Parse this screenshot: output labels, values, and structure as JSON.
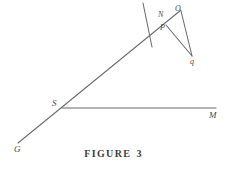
{
  "figure": {
    "caption_text": "FIGURE",
    "caption_number": "3",
    "background_color": "#ffffff",
    "line_color": "#6b6b6b",
    "label_color": "#4a4a4a"
  },
  "labels": {
    "n": "N",
    "o": "O",
    "p": "P",
    "q": "q",
    "s": "S",
    "m": "M",
    "g": "G"
  },
  "chart_data": {
    "type": "diagram",
    "points": [
      {
        "id": "G",
        "label": "G",
        "x": 18,
        "y": 143
      },
      {
        "id": "S",
        "label": "S",
        "x": 62,
        "y": 108
      },
      {
        "id": "P",
        "label": "P",
        "x": 168,
        "y": 27
      },
      {
        "id": "N",
        "label": "N",
        "x": 164,
        "y": 16
      },
      {
        "id": "O",
        "label": "O",
        "x": 181,
        "y": 10
      },
      {
        "id": "q",
        "label": "q",
        "x": 192,
        "y": 57
      },
      {
        "id": "M",
        "label": "M",
        "x": 215,
        "y": 108
      },
      {
        "id": "T",
        "label": "",
        "x": 143,
        "y": 3
      },
      {
        "id": "U",
        "label": "",
        "x": 152,
        "y": 47
      }
    ],
    "segments": [
      {
        "name": "ray-G-O",
        "from": "G",
        "to": "O",
        "x1": 18,
        "y1": 143,
        "x2": 181,
        "y2": 10
      },
      {
        "name": "ray-S-M",
        "from": "S",
        "to": "M",
        "x1": 62,
        "y1": 108,
        "x2": 216,
        "y2": 108
      },
      {
        "name": "transversal-T-U",
        "from": "T",
        "to": "U",
        "x1": 143,
        "y1": 3,
        "x2": 152,
        "y2": 47
      },
      {
        "name": "segment-O-q",
        "from": "O",
        "to": "q",
        "x1": 181,
        "y1": 11,
        "x2": 192,
        "y2": 56
      },
      {
        "name": "segment-P-q",
        "from": "P",
        "to": "q",
        "x1": 166,
        "y1": 25,
        "x2": 192,
        "y2": 56
      }
    ],
    "xlim": [
      0,
      227
    ],
    "ylim": [
      169,
      0
    ],
    "grid": false,
    "legend": null
  }
}
